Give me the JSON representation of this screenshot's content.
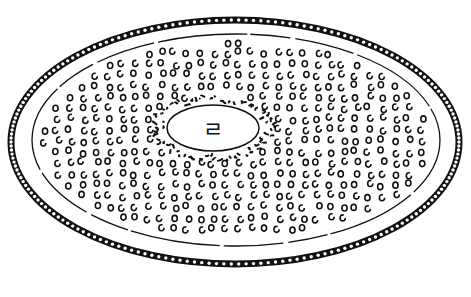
{
  "illustration": {
    "subject": "engraved dish with beaded rim",
    "center_glyph": "ㄹ",
    "colors": {
      "ink": "#111111",
      "paper": "#ffffff"
    },
    "outer_ring": {
      "cx": 235,
      "cy": 142,
      "rx": 224,
      "ry": 122
    },
    "plate_edge": {
      "cx": 236,
      "cy": 140,
      "rx": 204,
      "ry": 106
    },
    "center_boss": {
      "cx": 213,
      "cy": 128,
      "rx": 50,
      "ry": 26
    }
  }
}
